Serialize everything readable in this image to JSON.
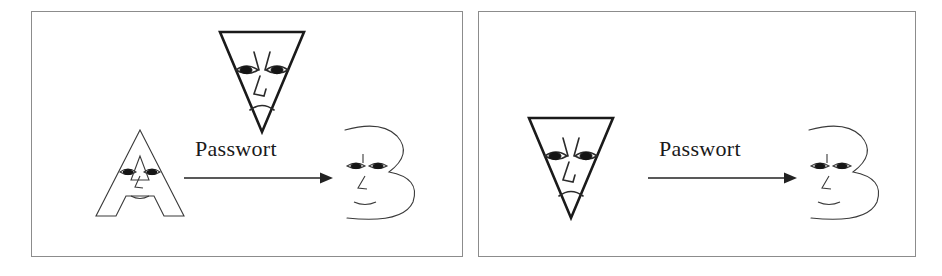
{
  "figure": {
    "background_color": "#ffffff",
    "border_color": "#8c8c8c",
    "ink_color": "#2b2b2b",
    "panels": [
      {
        "id": "panel-left",
        "caption": "",
        "sender": {
          "icon": "letter-a-face-character",
          "label": "A",
          "description": "outlined letter A with a neutral human face"
        },
        "eavesdropper": {
          "icon": "inverted-triangle-angry-face-character",
          "label": "",
          "position": "above-channel",
          "description": "downward pointing triangle with an angry frowning face"
        },
        "channel": {
          "label": "Passwort",
          "arrow": "right-arrow"
        },
        "receiver": {
          "icon": "letter-b-face-character",
          "label": "B",
          "description": "stylized letter B drawn as a face profile"
        }
      },
      {
        "id": "panel-right",
        "caption": "",
        "sender": {
          "icon": "inverted-triangle-angry-face-character",
          "label": "",
          "description": "downward pointing triangle with an angry frowning face impersonating A"
        },
        "eavesdropper": null,
        "channel": {
          "label": "Passwort",
          "arrow": "right-arrow"
        },
        "receiver": {
          "icon": "letter-b-face-character",
          "label": "B",
          "description": "stylized letter B drawn as a face profile"
        }
      }
    ]
  }
}
